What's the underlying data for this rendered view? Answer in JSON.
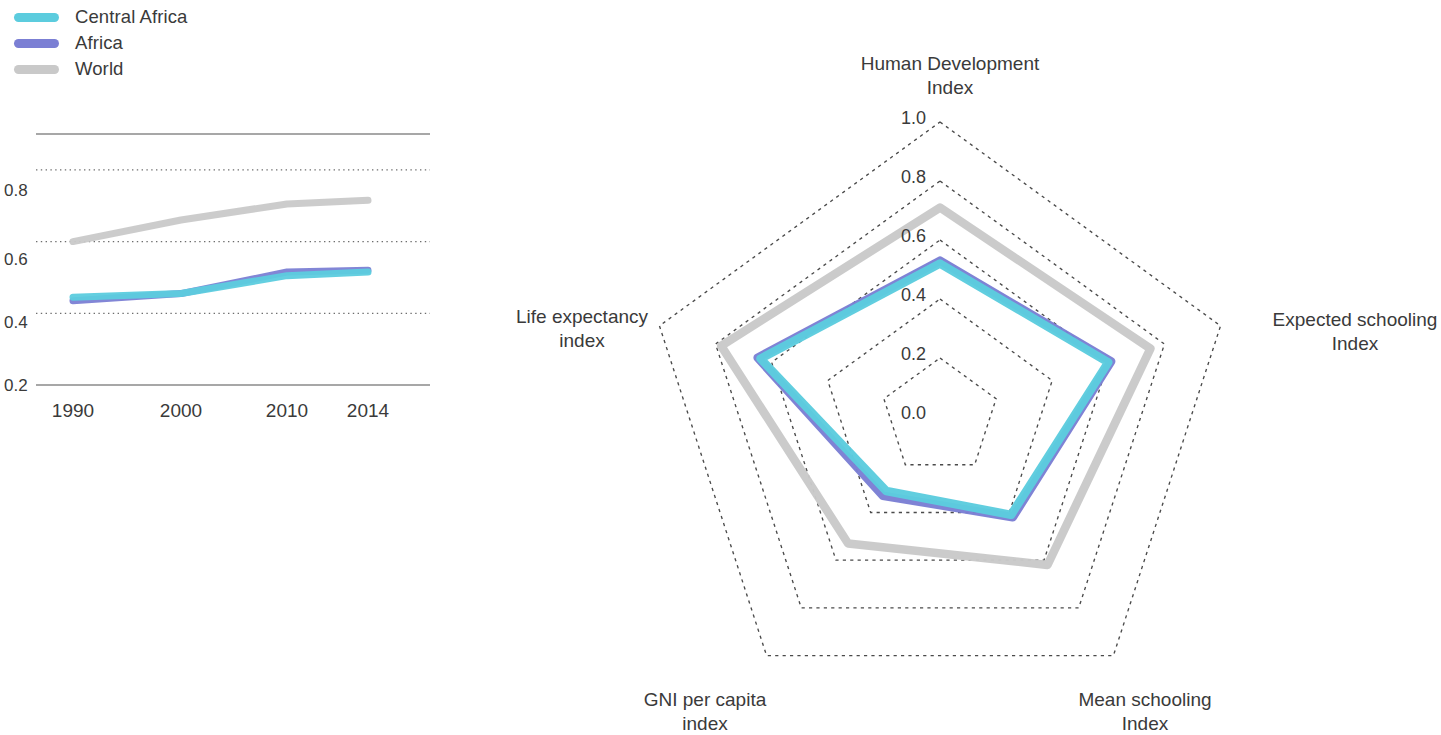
{
  "legend": {
    "items": [
      {
        "label": "Central Africa",
        "color": "#5CCCDE"
      },
      {
        "label": "Africa",
        "color": "#7B7FD4"
      },
      {
        "label": "World",
        "color": "#C9C9C9"
      }
    ]
  },
  "chart_data": [
    {
      "type": "line",
      "title": "",
      "xlabel": "",
      "ylabel": "",
      "categories": [
        "1990",
        "2000",
        "2010",
        "2014"
      ],
      "x_tick_labels": [
        "1990",
        "2000",
        "2010",
        "2014"
      ],
      "y_tick_labels": [
        "0.2",
        "0.4",
        "0.6",
        "0.8"
      ],
      "y_ticks": [
        0.2,
        0.4,
        0.6,
        0.8
      ],
      "ylim": [
        0.2,
        0.9
      ],
      "grid": "horizontal-dotted",
      "legend_position": "top-left-external",
      "series": [
        {
          "name": "Central Africa",
          "color": "#5CCCDE",
          "values": [
            0.445,
            0.455,
            0.505,
            0.515
          ]
        },
        {
          "name": "Africa",
          "color": "#7B7FD4",
          "values": [
            0.435,
            0.455,
            0.515,
            0.52
          ]
        },
        {
          "name": "World",
          "color": "#C9C9C9",
          "values": [
            0.6,
            0.66,
            0.705,
            0.715
          ]
        }
      ]
    },
    {
      "type": "radar",
      "title": "",
      "axes": [
        "Human Development Index",
        "Expected schooling Index",
        "Mean schooling Index",
        "GNI per capita index",
        "Life expectancy index"
      ],
      "axis_labels": [
        {
          "line1": "Human Development",
          "line2": "Index"
        },
        {
          "line1": "Expected schooling",
          "line2": "Index"
        },
        {
          "line1": "Mean schooling",
          "line2": "Index"
        },
        {
          "line1": "GNI per capita",
          "line2": "index"
        },
        {
          "line1": "Life expectancy",
          "line2": "index"
        }
      ],
      "scale_tick_labels": [
        "0.0",
        "0.2",
        "0.4",
        "0.6",
        "0.8",
        "1.0"
      ],
      "scale_ticks": [
        0.0,
        0.2,
        0.4,
        0.6,
        0.8,
        1.0
      ],
      "rlim": [
        0.0,
        1.0
      ],
      "grid": "dotted-pentagon",
      "series": [
        {
          "name": "Central Africa",
          "color": "#5CCCDE",
          "values": [
            0.52,
            0.6,
            0.41,
            0.31,
            0.64
          ]
        },
        {
          "name": "Africa",
          "color": "#7B7FD4",
          "values": [
            0.53,
            0.61,
            0.42,
            0.33,
            0.65
          ]
        },
        {
          "name": "World",
          "color": "#C9C9C9",
          "values": [
            0.71,
            0.75,
            0.62,
            0.53,
            0.78
          ]
        }
      ]
    }
  ]
}
